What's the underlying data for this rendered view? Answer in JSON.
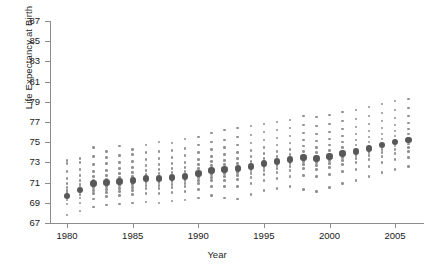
{
  "chart_data": {
    "type": "scatter",
    "title": "",
    "xlabel": "Year",
    "ylabel": "Life Expectancy at Birth",
    "xlim": [
      1978.7,
      1007.0
    ],
    "ylim": [
      67,
      87
    ],
    "yticks": [
      67,
      69,
      71,
      73,
      75,
      77,
      79,
      81,
      83,
      85,
      87
    ],
    "xticks": [
      1980,
      1985,
      1990,
      1995,
      2000,
      2005
    ],
    "grid": false,
    "legend": null,
    "x": [
      1980,
      1981,
      1982,
      1983,
      1984,
      1985,
      1986,
      1987,
      1988,
      1989,
      1990,
      1991,
      1992,
      1993,
      1994,
      1995,
      1996,
      1997,
      1998,
      1999,
      2000,
      2001,
      2002,
      2003,
      2004,
      2005,
      2006
    ],
    "series": [
      {
        "name": "Mean Life Expectancy",
        "marker": "large-dark-dot",
        "values": [
          69.7,
          70.3,
          70.9,
          71.0,
          71.1,
          71.2,
          71.4,
          71.4,
          71.5,
          71.6,
          71.9,
          72.2,
          72.3,
          72.4,
          72.6,
          72.9,
          73.1,
          73.3,
          73.5,
          73.4,
          73.6,
          73.9,
          74.1,
          74.4,
          74.7,
          75.0,
          75.2
        ]
      },
      {
        "name": "Individual Observations",
        "marker": "small-gray-dot",
        "values_by_year": [
          [
            67.8,
            68.9,
            69.3,
            69.6,
            69.8,
            70.0,
            70.2,
            70.5,
            70.9,
            71.4,
            72.1,
            72.9,
            73.2
          ],
          [
            68.2,
            69.0,
            69.5,
            69.8,
            70.1,
            70.3,
            70.5,
            70.8,
            71.2,
            71.7,
            72.3,
            73.0,
            73.4
          ],
          [
            68.6,
            69.4,
            69.9,
            70.2,
            70.5,
            70.7,
            70.9,
            71.2,
            71.6,
            72.1,
            72.8,
            73.6,
            74.5
          ],
          [
            68.8,
            69.6,
            70.0,
            70.3,
            70.6,
            70.8,
            71.0,
            71.3,
            71.7,
            72.2,
            72.9,
            73.5,
            74.1
          ],
          [
            68.9,
            69.7,
            70.1,
            70.4,
            70.7,
            70.9,
            71.1,
            71.5,
            71.9,
            72.4,
            73.0,
            73.7,
            74.6
          ],
          [
            69.0,
            69.8,
            70.2,
            70.5,
            70.8,
            71.0,
            71.2,
            71.6,
            72.0,
            72.5,
            73.1,
            73.8,
            74.3
          ],
          [
            69.1,
            69.9,
            70.4,
            70.7,
            71.0,
            71.2,
            71.4,
            71.8,
            72.2,
            72.7,
            73.3,
            74.0,
            74.7
          ],
          [
            69.0,
            69.9,
            70.4,
            70.7,
            71.0,
            71.2,
            71.5,
            71.9,
            72.3,
            72.8,
            73.4,
            74.1,
            75.0
          ],
          [
            69.2,
            70.0,
            70.5,
            70.8,
            71.1,
            71.3,
            71.6,
            72.0,
            72.4,
            72.9,
            73.5,
            74.2,
            74.9
          ],
          [
            69.3,
            70.1,
            70.6,
            70.9,
            71.2,
            71.4,
            71.7,
            72.1,
            72.5,
            73.0,
            73.7,
            74.4,
            75.3
          ],
          [
            69.5,
            70.3,
            70.9,
            71.2,
            71.5,
            71.7,
            72.0,
            72.4,
            72.8,
            73.3,
            74.0,
            74.7,
            75.5
          ],
          [
            69.7,
            70.6,
            71.2,
            71.5,
            71.8,
            72.0,
            72.3,
            72.7,
            73.1,
            73.6,
            74.3,
            75.0,
            75.9
          ],
          [
            69.5,
            70.6,
            71.2,
            71.6,
            71.9,
            72.1,
            72.4,
            72.8,
            73.2,
            73.8,
            74.5,
            75.2,
            76.2
          ],
          [
            69.4,
            70.6,
            71.3,
            71.7,
            72.0,
            72.2,
            72.5,
            72.9,
            73.4,
            74.0,
            74.7,
            75.5,
            76.4
          ],
          [
            69.8,
            70.9,
            71.5,
            71.9,
            72.2,
            72.4,
            72.7,
            73.1,
            73.6,
            74.2,
            74.9,
            75.7,
            76.6
          ],
          [
            70.2,
            71.2,
            71.8,
            72.2,
            72.5,
            72.7,
            73.0,
            73.4,
            73.9,
            74.5,
            75.2,
            76.0,
            76.8
          ],
          [
            70.4,
            71.4,
            72.0,
            72.4,
            72.7,
            72.9,
            73.2,
            73.6,
            74.1,
            74.7,
            75.4,
            76.2,
            77.0
          ],
          [
            70.6,
            71.6,
            72.2,
            72.6,
            72.9,
            73.1,
            73.4,
            73.8,
            74.3,
            74.9,
            75.6,
            76.4,
            77.2
          ],
          [
            70.3,
            71.7,
            72.4,
            72.8,
            73.1,
            73.4,
            73.7,
            74.1,
            74.6,
            75.2,
            75.9,
            76.7,
            77.6
          ],
          [
            70.1,
            71.6,
            72.3,
            72.7,
            73.0,
            73.3,
            73.6,
            74.0,
            74.5,
            75.1,
            75.8,
            76.6,
            77.5
          ],
          [
            70.5,
            71.8,
            72.5,
            72.9,
            73.2,
            73.5,
            73.8,
            74.2,
            74.7,
            75.3,
            76.0,
            76.8,
            77.7
          ],
          [
            70.9,
            72.1,
            72.8,
            73.2,
            73.5,
            73.8,
            74.1,
            74.5,
            75.0,
            75.6,
            76.3,
            77.1,
            78.0
          ],
          [
            71.2,
            72.3,
            73.0,
            73.4,
            73.7,
            74.0,
            74.3,
            74.7,
            75.2,
            75.8,
            76.5,
            77.3,
            78.2
          ],
          [
            71.6,
            72.6,
            73.3,
            73.7,
            74.0,
            74.3,
            74.6,
            75.0,
            75.5,
            76.1,
            76.8,
            77.6,
            78.5
          ],
          [
            72.0,
            73.0,
            73.6,
            74.0,
            74.3,
            74.6,
            74.9,
            75.3,
            75.8,
            76.4,
            77.1,
            77.9,
            78.8
          ],
          [
            72.3,
            73.3,
            73.9,
            74.3,
            74.6,
            74.9,
            75.2,
            75.6,
            76.1,
            76.7,
            77.4,
            78.2,
            79.1
          ],
          [
            72.6,
            73.5,
            74.1,
            74.5,
            74.8,
            75.1,
            75.4,
            75.8,
            76.3,
            76.9,
            77.6,
            78.4,
            79.3
          ]
        ]
      }
    ],
    "colors": {
      "mean_dot": "#585858",
      "scatter_dot": "#919191",
      "axis": "#8c8c8c",
      "text": "#1a1a1a",
      "background": "#ffffff"
    }
  }
}
